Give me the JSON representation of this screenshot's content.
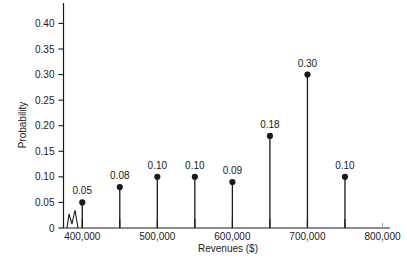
{
  "chart_data": {
    "type": "bar",
    "title": "",
    "subtitle": "",
    "xlabel": "Revenues ($)",
    "ylabel": "Probability",
    "categories": [
      "400,000",
      "450,000",
      "500,000",
      "550,000",
      "600,000",
      "650,000",
      "700,000",
      "750,000"
    ],
    "x": [
      400000,
      450000,
      500000,
      550000,
      600000,
      650000,
      700000,
      750000
    ],
    "values": [
      0.05,
      0.08,
      0.1,
      0.1,
      0.09,
      0.18,
      0.3,
      0.1
    ],
    "data_labels": [
      "0.05",
      "0.08",
      "0.10",
      "0.10",
      "0.09",
      "0.18",
      "0.30",
      "0.10"
    ],
    "xlim": [
      375000,
      810000
    ],
    "ylim": [
      0,
      0.44
    ],
    "grid": false,
    "legend": null,
    "axis_break": true,
    "xtick_values": [
      400000,
      450000,
      500000,
      550000,
      600000,
      650000,
      700000,
      750000,
      800000
    ],
    "xtick_labels": [
      "400,000",
      "",
      "500,000",
      "",
      "600,000",
      "",
      "700,000",
      "",
      "800,000"
    ],
    "ytick_values": [
      0,
      0.05,
      0.1,
      0.15,
      0.2,
      0.25,
      0.3,
      0.35,
      0.4
    ],
    "ytick_labels": [
      "0",
      "0.05",
      "0.10",
      "0.15",
      "0.20",
      "0.25",
      "0.30",
      "0.35",
      "0.40"
    ],
    "marker": "filled-circle",
    "series_color": "#1a1a1a"
  },
  "caption": {
    "text": ""
  }
}
